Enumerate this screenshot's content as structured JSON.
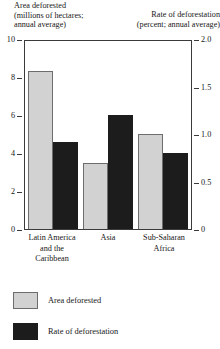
{
  "chart_data": {
    "type": "bar",
    "title": "",
    "categories": [
      "Latin America\nand the\nCaribbean",
      "Asia",
      "Sub-Saharan\nAfrica"
    ],
    "series": [
      {
        "name": "Area deforested",
        "axis": "left",
        "unit": "millions of hectares; annual average",
        "color": "#d2d2d2",
        "values": [
          8.3,
          3.5,
          5.0
        ]
      },
      {
        "name": "Rate of deforestation",
        "axis": "right",
        "unit": "percent; annual average",
        "color": "#1c1c1c",
        "values": [
          0.92,
          1.2,
          0.8
        ]
      }
    ],
    "left_axis": {
      "label": "Area deforested\n(millions of hectares;\nannual average)",
      "ticks": [
        "0",
        "2",
        "4",
        "6",
        "8",
        "10"
      ],
      "tick_values": [
        0,
        2,
        4,
        6,
        8,
        10
      ],
      "ylim": [
        0,
        10
      ]
    },
    "right_axis": {
      "label": "Rate of deforestation\n(percent; annual average)",
      "ticks": [
        "0",
        "0.5",
        "1.0",
        "1.5",
        "2.0"
      ],
      "tick_values": [
        0,
        0.5,
        1.0,
        1.5,
        2.0
      ],
      "ylim": [
        0,
        2.0
      ]
    },
    "grid": false,
    "legend_position": "bottom-left",
    "legend": [
      {
        "label": "Area deforested",
        "color": "#d2d2d2"
      },
      {
        "label": "Rate of deforestation",
        "color": "#1c1c1c"
      }
    ]
  }
}
